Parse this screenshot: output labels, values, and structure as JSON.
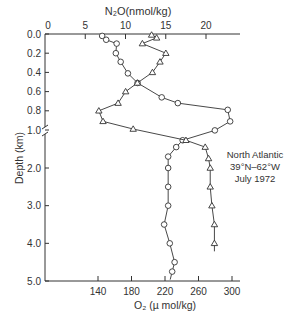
{
  "chart_data": {
    "type": "line",
    "title": "",
    "annotation": [
      "North Atlantic",
      "39°N–62°W",
      "July 1972"
    ],
    "ylabel": "Depth (km)",
    "y_ticks": [
      "0.0",
      "0.2",
      "0.4",
      "0.6",
      "0.8",
      "1.0",
      "2.0",
      "3.0",
      "4.0",
      "5.0"
    ],
    "y_axis_break": "between 1.0 and 2.0 km (scale change)",
    "ylim": [
      0,
      5.0
    ],
    "top_axis": {
      "label": "N₂O (nmol/kg)",
      "ticks": [
        0,
        5,
        10,
        15,
        20
      ],
      "range": [
        0,
        23
      ]
    },
    "bottom_axis": {
      "label": "O₂ (µ mol/kg)",
      "ticks": [
        140,
        180,
        220,
        260,
        300
      ],
      "range": [
        84,
        313
      ]
    },
    "series": [
      {
        "name": "N₂O",
        "marker": "circle",
        "axis": "top",
        "points": [
          {
            "depth": 0.02,
            "value": 7.1
          },
          {
            "depth": 0.06,
            "value": 7.6
          },
          {
            "depth": 0.1,
            "value": 8.9
          },
          {
            "depth": 0.2,
            "value": 8.8
          },
          {
            "depth": 0.29,
            "value": 9.4
          },
          {
            "depth": 0.41,
            "value": 10.3
          },
          {
            "depth": 0.51,
            "value": 11.5
          },
          {
            "depth": 0.66,
            "value": 14.5
          },
          {
            "depth": 0.72,
            "value": 16.5
          },
          {
            "depth": 0.79,
            "value": 22.7
          },
          {
            "depth": 0.91,
            "value": 23.0
          },
          {
            "depth": 1.01,
            "value": 21.1
          },
          {
            "depth": 1.27,
            "value": 17.1
          },
          {
            "depth": 1.45,
            "value": 16.3
          },
          {
            "depth": 1.7,
            "value": 15.3
          },
          {
            "depth": 2.0,
            "value": 15.3
          },
          {
            "depth": 2.5,
            "value": 15.3
          },
          {
            "depth": 3.0,
            "value": 15.3
          },
          {
            "depth": 3.5,
            "value": 14.8
          },
          {
            "depth": 4.0,
            "value": 15.5
          },
          {
            "depth": 4.5,
            "value": 16.1
          },
          {
            "depth": 4.75,
            "value": 15.8
          }
        ]
      },
      {
        "name": "O₂",
        "marker": "triangle",
        "axis": "bottom",
        "points": [
          {
            "depth": 0.01,
            "value": 204
          },
          {
            "depth": 0.04,
            "value": 210
          },
          {
            "depth": 0.1,
            "value": 193
          },
          {
            "depth": 0.2,
            "value": 221
          },
          {
            "depth": 0.29,
            "value": 214
          },
          {
            "depth": 0.4,
            "value": 205
          },
          {
            "depth": 0.51,
            "value": 187
          },
          {
            "depth": 0.6,
            "value": 173
          },
          {
            "depth": 0.72,
            "value": 164
          },
          {
            "depth": 0.8,
            "value": 141
          },
          {
            "depth": 0.91,
            "value": 146
          },
          {
            "depth": 0.99,
            "value": 182
          },
          {
            "depth": 1.27,
            "value": 245
          },
          {
            "depth": 1.45,
            "value": 268
          },
          {
            "depth": 1.75,
            "value": 272
          },
          {
            "depth": 2.0,
            "value": 274
          },
          {
            "depth": 2.5,
            "value": 274
          },
          {
            "depth": 3.0,
            "value": 276
          },
          {
            "depth": 3.5,
            "value": 279
          },
          {
            "depth": 4.0,
            "value": 279
          }
        ]
      }
    ]
  },
  "labels": {
    "top_axis_label": "N₂O(nmol/kg)",
    "bottom_axis_label": "O₂ (µ mol/kg)",
    "y_axis_label": "Depth (km)",
    "annotation_line1": "North Atlantic",
    "annotation_line2": "39°N–62°W",
    "annotation_line3": "July 1972"
  }
}
